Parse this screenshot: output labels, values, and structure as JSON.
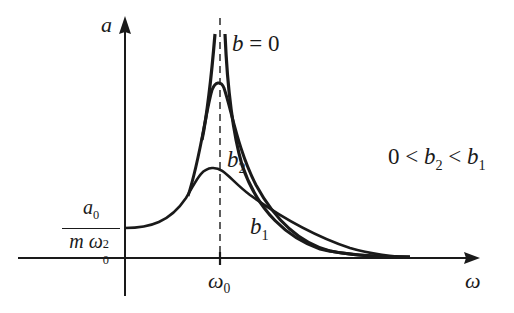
{
  "diagram": {
    "type": "resonance-amplitude-curves",
    "axes": {
      "y_label": "a",
      "x_label": "ω",
      "x_tick_label": {
        "base": "ω",
        "sub": "0"
      },
      "y_intercept_label": {
        "numerator": {
          "base": "a",
          "sub": "0"
        },
        "denominator": {
          "prefix": "m ",
          "base": "ω",
          "sub": "0",
          "sup": "2"
        }
      }
    },
    "curves": [
      {
        "name": "b=0",
        "label": "b = 0",
        "label_base": "b",
        "label_rest": " = 0",
        "description": "undamped, diverges at ω0"
      },
      {
        "name": "b2",
        "label_base": "b",
        "label_sub": "2",
        "description": "small damping, tall peak"
      },
      {
        "name": "b1",
        "label_base": "b",
        "label_sub": "1",
        "description": "larger damping, low broad peak"
      }
    ],
    "annotation": {
      "text": "0 < b2 < b1",
      "parts": [
        "0 < ",
        "b",
        "2",
        " < ",
        "b",
        "1"
      ]
    },
    "colors": {
      "ink": "#1a1a1a",
      "background": "#ffffff"
    }
  }
}
